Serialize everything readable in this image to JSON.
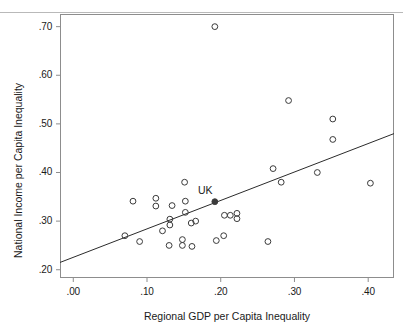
{
  "figure": {
    "background": "#ffffff",
    "frame_color": "#8d8d8d",
    "marker_color": "#3a3a3a",
    "line_color": "#2b2b2b",
    "annotation": "UK"
  },
  "chart_data": {
    "type": "scatter",
    "title": "",
    "xlabel": "Regional GDP per Capita Inequality",
    "ylabel": "National Income per Capita Inequality",
    "xlim": [
      -0.018,
      0.435
    ],
    "ylim": [
      0.183,
      0.726
    ],
    "xticks": [
      0.0,
      0.1,
      0.2,
      0.3,
      0.4
    ],
    "xtick_labels": [
      ".00",
      ".10",
      ".20",
      ".30",
      ".40"
    ],
    "yticks": [
      0.2,
      0.3,
      0.4,
      0.5,
      0.6,
      0.7
    ],
    "ytick_labels": [
      ".20",
      ".30",
      ".40",
      ".50",
      ".60",
      ".70"
    ],
    "grid": false,
    "legend": null,
    "points": [
      {
        "x": 0.192,
        "y": 0.7,
        "filled": false
      },
      {
        "x": 0.292,
        "y": 0.548,
        "filled": false
      },
      {
        "x": 0.352,
        "y": 0.51,
        "filled": false
      },
      {
        "x": 0.352,
        "y": 0.468,
        "filled": false
      },
      {
        "x": 0.271,
        "y": 0.408,
        "filled": false
      },
      {
        "x": 0.331,
        "y": 0.4,
        "filled": false
      },
      {
        "x": 0.282,
        "y": 0.38,
        "filled": false
      },
      {
        "x": 0.403,
        "y": 0.378,
        "filled": false
      },
      {
        "x": 0.151,
        "y": 0.38,
        "filled": false
      },
      {
        "x": 0.081,
        "y": 0.341,
        "filled": false
      },
      {
        "x": 0.112,
        "y": 0.347,
        "filled": false
      },
      {
        "x": 0.112,
        "y": 0.331,
        "filled": false
      },
      {
        "x": 0.152,
        "y": 0.341,
        "filled": false
      },
      {
        "x": 0.134,
        "y": 0.332,
        "filled": false
      },
      {
        "x": 0.152,
        "y": 0.318,
        "filled": false
      },
      {
        "x": 0.131,
        "y": 0.304,
        "filled": false
      },
      {
        "x": 0.131,
        "y": 0.292,
        "filled": false
      },
      {
        "x": 0.16,
        "y": 0.296,
        "filled": false
      },
      {
        "x": 0.166,
        "y": 0.3,
        "filled": false
      },
      {
        "x": 0.205,
        "y": 0.312,
        "filled": false
      },
      {
        "x": 0.213,
        "y": 0.312,
        "filled": false
      },
      {
        "x": 0.222,
        "y": 0.316,
        "filled": false
      },
      {
        "x": 0.222,
        "y": 0.305,
        "filled": false
      },
      {
        "x": 0.121,
        "y": 0.28,
        "filled": false
      },
      {
        "x": 0.07,
        "y": 0.27,
        "filled": false
      },
      {
        "x": 0.09,
        "y": 0.258,
        "filled": false
      },
      {
        "x": 0.13,
        "y": 0.25,
        "filled": false
      },
      {
        "x": 0.148,
        "y": 0.262,
        "filled": false
      },
      {
        "x": 0.148,
        "y": 0.25,
        "filled": false
      },
      {
        "x": 0.161,
        "y": 0.248,
        "filled": false
      },
      {
        "x": 0.194,
        "y": 0.26,
        "filled": false
      },
      {
        "x": 0.204,
        "y": 0.27,
        "filled": false
      },
      {
        "x": 0.264,
        "y": 0.258,
        "filled": false
      },
      {
        "x": 0.192,
        "y": 0.34,
        "filled": true,
        "label": "UK"
      }
    ],
    "fit_line": {
      "x0": -0.018,
      "y0": 0.215,
      "x1": 0.435,
      "y1": 0.48
    }
  }
}
